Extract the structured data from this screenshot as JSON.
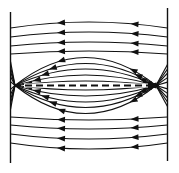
{
  "figure": {
    "name": "field-lines-through-lens-diagram",
    "background": "#ffffff",
    "stroke_color": "#111111",
    "canvas": {
      "width": 179,
      "height": 173
    },
    "direction": "right-to-left",
    "plates": {
      "left": {
        "x": 10.5,
        "y1": 12,
        "y2": 163,
        "width": 1.4
      },
      "right": {
        "x": 167.5,
        "y1": 8,
        "y2": 161,
        "width": 1.4
      }
    },
    "axis_y": 85.5,
    "center_line": {
      "x1": 14,
      "x2": 159,
      "dash": "7 4",
      "width": 1.8,
      "halo_x1": 24,
      "halo_x2": 148,
      "halo_half": 2.1
    },
    "line_width": 1.15,
    "outer_lines": [
      {
        "plate_y": 28,
        "mid_y": 22
      },
      {
        "plate_y": 37,
        "mid_y": 32
      },
      {
        "plate_y": 46,
        "mid_y": 42
      },
      {
        "plate_y": 54,
        "mid_y": 51
      },
      {
        "plate_y": 117,
        "mid_y": 120
      },
      {
        "plate_y": 125,
        "mid_y": 129
      },
      {
        "plate_y": 134,
        "mid_y": 139
      },
      {
        "plate_y": 143,
        "mid_y": 149
      }
    ],
    "lens": {
      "vertex_left_x": 15,
      "vertex_right_x": 156,
      "amplitudes": [
        28,
        22,
        16.5,
        10.5,
        4.5
      ],
      "fan_left_scale": 0.85,
      "fan_right_scale": 0.75,
      "arrow_left_base": 18,
      "arrow_left_k": 1.4,
      "arrow_right_base": 152,
      "arrow_right_k": 0.8
    },
    "outer_arrow_x": [
      57,
      130.5
    ],
    "arrow": {
      "len": 8,
      "half_w": 2.9
    }
  }
}
